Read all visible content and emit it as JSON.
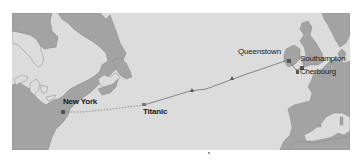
{
  "map": {
    "title": "Titanic voyage route",
    "colors": {
      "background": "#ffffff",
      "sea": "#dcdcdc",
      "land": "#a3a3a3",
      "coastline": "#8a8a8a",
      "route_line": "#7a7a7a",
      "marker": "#555555",
      "label_text": "#1a1a1a"
    },
    "labels": {
      "new_york": "New York",
      "titanic": "Titanic",
      "queenstown": "Queenstown",
      "southampton": "Southampton",
      "cherbourg": "Cherbourg"
    },
    "route": {
      "traveled": "Southampton → Cherbourg → Queenstown → Titanic (sinking point)",
      "planned_remaining": "Titanic → New York (dotted)"
    }
  }
}
